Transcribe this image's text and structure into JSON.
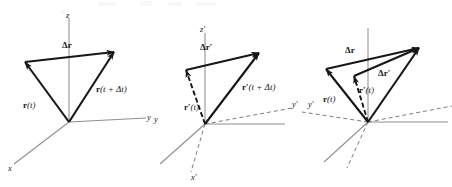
{
  "figure": {
    "caption": "",
    "panel_count": 3,
    "background_color": "#ffffff",
    "ink_color": "#17171a",
    "axis_color": "#8a8a8f",
    "dashed_color": "#7d7d82"
  },
  "panel1": {
    "name": "unprimed-frame",
    "axes": [
      {
        "id": "z",
        "label": "z",
        "style": "solid"
      },
      {
        "id": "y",
        "label": "y",
        "style": "solid"
      },
      {
        "id": "x",
        "label": "x",
        "style": "solid"
      }
    ],
    "vectors": [
      {
        "id": "r_t",
        "label_parts": {
          "bold": "r",
          "rest": "(t)"
        },
        "style": "solid",
        "arrow": true
      },
      {
        "id": "r_t_dt",
        "label_parts": {
          "bold": "r",
          "rest": "(t + Δt)"
        },
        "style": "solid",
        "arrow": true
      },
      {
        "id": "delta_r",
        "label_parts": {
          "bold": "Δr",
          "rest": ""
        },
        "style": "solid",
        "arrow": true
      }
    ]
  },
  "panel2": {
    "name": "primed-frame",
    "axes": [
      {
        "id": "z_prime",
        "label": "z′",
        "style": "solid"
      },
      {
        "id": "y_prime",
        "label": "y′",
        "style": "solid"
      },
      {
        "id": "x_prime",
        "label": "x′",
        "style": "dashed"
      },
      {
        "id": "y",
        "label": "y",
        "style": "solid"
      }
    ],
    "vectors": [
      {
        "id": "r_prime_t",
        "label_parts": {
          "bold": "r′",
          "rest": "(t)"
        },
        "style": "dashed",
        "arrow": true
      },
      {
        "id": "r_prime_t_dt",
        "label_parts": {
          "bold": "r′",
          "rest": "(t + Δt)"
        },
        "style": "solid",
        "arrow": true
      },
      {
        "id": "delta_r_prime",
        "label_parts": {
          "bold": "Δr′",
          "rest": ""
        },
        "style": "solid",
        "arrow": true
      }
    ]
  },
  "panel3": {
    "name": "both-frames",
    "axes": [
      {
        "id": "z",
        "label": "",
        "style": "solid"
      },
      {
        "id": "y",
        "label": "",
        "style": "solid"
      },
      {
        "id": "x",
        "label": "",
        "style": "solid"
      },
      {
        "id": "y_prime",
        "label": "y′",
        "style": "dashed"
      },
      {
        "id": "x_prime",
        "label": "",
        "style": "dashed"
      }
    ],
    "vectors": [
      {
        "id": "delta_r",
        "label_parts": {
          "bold": "Δr",
          "rest": ""
        },
        "style": "solid",
        "arrow": true
      },
      {
        "id": "delta_r_prime",
        "label_parts": {
          "bold": "Δr′",
          "rest": ""
        },
        "style": "solid",
        "arrow": true
      },
      {
        "id": "r_t",
        "label_parts": {
          "bold": "r",
          "rest": "(t)"
        },
        "style": "solid",
        "arrow": true
      },
      {
        "id": "r_prime_t",
        "label_parts": {
          "bold": "r′",
          "rest": "(t)"
        },
        "style": "dashed",
        "arrow": true
      }
    ]
  },
  "labels": {
    "z": "z",
    "y": "y",
    "x": "x",
    "z_prime": "z′",
    "y_prime": "y′",
    "x_prime": "x′",
    "delta_r": "Δr",
    "delta_r_prime": "Δr′",
    "r_bold": "r",
    "r_prime_bold": "r′",
    "of_t": "(t)",
    "of_t_plus_dt": "(t + Δt)"
  }
}
